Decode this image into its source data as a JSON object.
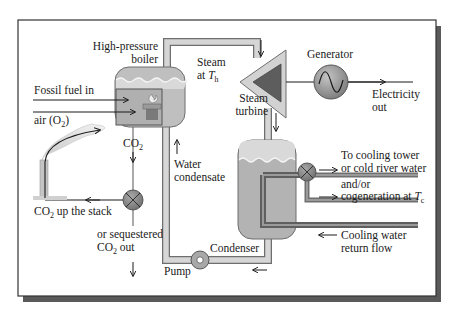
{
  "diagram": {
    "type": "fossil-fuel power plant schematic",
    "colors": {
      "frame_border": "#333333",
      "frame_shadow": "#555555",
      "pipe_fill": "#bdbdbd",
      "pipe_outline": "#6e6e6e",
      "water": "#a9a9a9",
      "steam": "#d9d9d9",
      "valve": "#8a8a8a",
      "turbine_outer": "#cfcfcf",
      "turbine_inner": "#5f5f5f",
      "generator": "#9a9a9a",
      "cooling_pipe": "#7d7d7d"
    },
    "labels": {
      "boiler_line1": "High-pressure",
      "boiler_line2": "boiler",
      "steam_line1": "Steam",
      "steam_line2_prefix": "at ",
      "steam_temp_symbol": "T",
      "steam_temp_sub": "h",
      "generator": "Generator",
      "electricity_line1": "Electricity",
      "electricity_line2": "out",
      "turbine_line1": "Steam",
      "turbine_line2": "turbine",
      "fossil_fuel": "Fossil fuel in",
      "air_prefix": "air (O",
      "air_sub": "2",
      "air_suffix": ")",
      "co2_prefix": "CO",
      "co2_sub": "2",
      "water_line1": "Water",
      "water_line2": "condensate",
      "stack_prefix": "CO",
      "stack_sub": "2",
      "stack_suffix": " up the stack",
      "sequestered_line1": "or sequestered",
      "sequestered_prefix": "CO",
      "sequestered_sub": "2",
      "sequestered_suffix": " out",
      "cooling_tower_line1": "To cooling tower",
      "cooling_tower_line2": "or cold river water",
      "cogen_line1": "and/or",
      "cogen_line2_prefix": "cogeneration at ",
      "cogen_temp_symbol": "T",
      "cogen_temp_sub": "c",
      "return_line1": "Cooling water",
      "return_line2": "return flow",
      "condenser": "Condenser",
      "pump": "Pump"
    },
    "icons": {
      "flame": "flame-icon",
      "sine_wave": "ac-sine-icon",
      "valve_cross": "valve-x-icon"
    }
  }
}
